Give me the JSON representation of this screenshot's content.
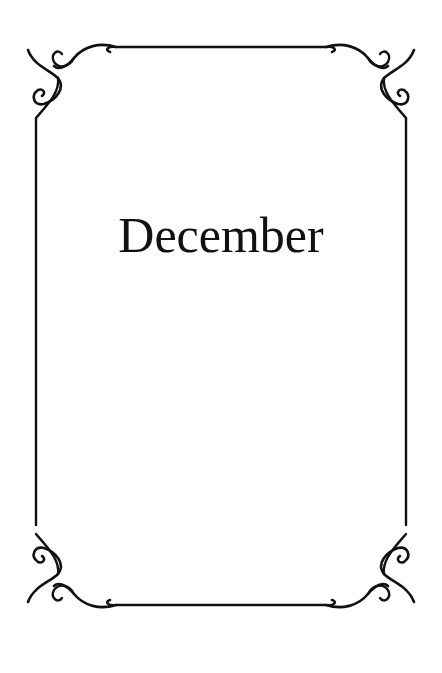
{
  "page": {
    "title": "December",
    "colors": {
      "background": "#ffffff",
      "ink": "#111111"
    },
    "ornaments": [
      "corner-scroll-top-left",
      "corner-scroll-top-right",
      "corner-scroll-bottom-left",
      "corner-scroll-bottom-right"
    ]
  }
}
